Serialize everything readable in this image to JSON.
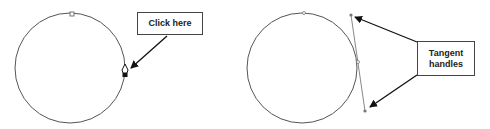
{
  "panels": [
    {
      "id": "left",
      "callout": {
        "text": "Click here"
      },
      "description": "Circle path with pen tool cursor on right anchor point"
    },
    {
      "id": "right",
      "callout": {
        "line1": "Tangent",
        "line2": "handles"
      },
      "description": "Circle path with tangent handles extended from right anchor point"
    }
  ],
  "colors": {
    "path": "#555555",
    "handle": "#888888",
    "arrow": "#111111",
    "box_border": "#444444"
  }
}
